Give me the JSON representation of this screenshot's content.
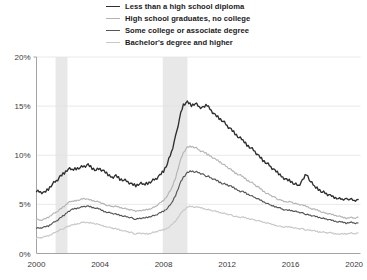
{
  "chart_data": {
    "type": "line",
    "title": "",
    "subtitle": "",
    "xlabel": "",
    "ylabel": "",
    "xlim": [
      2000,
      2020.4
    ],
    "ylim": [
      0,
      20
    ],
    "grid": true,
    "grid_axis": "y",
    "legend_position": "top-center",
    "y_ticks": [
      0,
      5,
      10,
      15,
      20
    ],
    "y_tick_labels": [
      "0%",
      "5%",
      "10%",
      "15%",
      "20%"
    ],
    "x_ticks": [
      2000,
      2004,
      2008,
      2012,
      2016,
      2020
    ],
    "x_tick_labels": [
      "2000",
      "2004",
      "2008",
      "2012",
      "2016",
      "2020"
    ],
    "annotations": [
      {
        "type": "shaded-band",
        "name": "recession-2001",
        "x0": 2001.2,
        "x1": 2001.95,
        "color": "#e8e8e8"
      },
      {
        "type": "shaded-band",
        "name": "recession-2008",
        "x0": 2007.95,
        "x1": 2009.5,
        "color": "#e8e8e8"
      }
    ],
    "series": [
      {
        "name": "Less than a high school diploma",
        "color": "#2e2e2e",
        "width": 1.35,
        "x": [
          2000.0,
          2000.25,
          2000.5,
          2000.75,
          2001.0,
          2001.25,
          2001.5,
          2001.75,
          2002.0,
          2002.25,
          2002.5,
          2002.75,
          2003.0,
          2003.25,
          2003.5,
          2003.75,
          2004.0,
          2004.25,
          2004.5,
          2004.75,
          2005.0,
          2005.25,
          2005.5,
          2005.75,
          2006.0,
          2006.25,
          2006.5,
          2006.75,
          2007.0,
          2007.25,
          2007.5,
          2007.75,
          2008.0,
          2008.25,
          2008.5,
          2008.75,
          2009.0,
          2009.25,
          2009.5,
          2009.75,
          2010.0,
          2010.25,
          2010.5,
          2010.75,
          2011.0,
          2011.25,
          2011.5,
          2011.75,
          2012.0,
          2012.25,
          2012.5,
          2012.75,
          2013.0,
          2013.25,
          2013.5,
          2013.75,
          2014.0,
          2014.25,
          2014.5,
          2014.75,
          2015.0,
          2015.25,
          2015.5,
          2015.75,
          2016.0,
          2016.25,
          2016.5,
          2016.75,
          2017.0,
          2017.25,
          2017.5,
          2017.75,
          2018.0,
          2018.25,
          2018.5,
          2018.75,
          2019.0,
          2019.25,
          2019.5,
          2019.75,
          2020.0,
          2020.25
        ],
        "values": [
          6.4,
          6.3,
          6.2,
          6.6,
          7.1,
          7.4,
          7.8,
          8.2,
          8.6,
          8.5,
          8.7,
          8.8,
          8.9,
          9.0,
          8.7,
          8.5,
          8.6,
          8.3,
          8.0,
          7.8,
          7.9,
          7.6,
          7.5,
          7.3,
          7.0,
          6.9,
          7.1,
          7.0,
          7.2,
          7.4,
          7.6,
          7.9,
          8.4,
          9.2,
          10.3,
          11.8,
          13.8,
          15.2,
          15.4,
          15.1,
          15.3,
          14.9,
          14.8,
          15.1,
          14.6,
          14.1,
          13.8,
          13.5,
          13.0,
          12.6,
          12.2,
          11.8,
          11.5,
          11.1,
          10.8,
          10.4,
          9.9,
          9.5,
          9.2,
          8.8,
          8.4,
          8.1,
          7.8,
          7.5,
          7.4,
          7.1,
          6.9,
          7.4,
          8.1,
          7.3,
          6.8,
          6.6,
          6.3,
          6.1,
          5.9,
          5.7,
          5.6,
          5.5,
          5.5,
          5.6,
          5.4,
          5.5
        ]
      },
      {
        "name": "High school graduates, no college",
        "color": "#b4b4b4",
        "width": 1.15,
        "x": [
          2000.0,
          2000.25,
          2000.5,
          2000.75,
          2001.0,
          2001.25,
          2001.5,
          2001.75,
          2002.0,
          2002.25,
          2002.5,
          2002.75,
          2003.0,
          2003.25,
          2003.5,
          2003.75,
          2004.0,
          2004.25,
          2004.5,
          2004.75,
          2005.0,
          2005.25,
          2005.5,
          2005.75,
          2006.0,
          2006.25,
          2006.5,
          2006.75,
          2007.0,
          2007.25,
          2007.5,
          2007.75,
          2008.0,
          2008.25,
          2008.5,
          2008.75,
          2009.0,
          2009.25,
          2009.5,
          2009.75,
          2010.0,
          2010.25,
          2010.5,
          2010.75,
          2011.0,
          2011.25,
          2011.5,
          2011.75,
          2012.0,
          2012.25,
          2012.5,
          2012.75,
          2013.0,
          2013.25,
          2013.5,
          2013.75,
          2014.0,
          2014.25,
          2014.5,
          2014.75,
          2015.0,
          2015.25,
          2015.5,
          2015.75,
          2016.0,
          2016.25,
          2016.5,
          2016.75,
          2017.0,
          2017.25,
          2017.5,
          2017.75,
          2018.0,
          2018.25,
          2018.5,
          2018.75,
          2019.0,
          2019.25,
          2019.5,
          2019.75,
          2020.0,
          2020.25
        ],
        "values": [
          3.5,
          3.4,
          3.5,
          3.7,
          4.0,
          4.2,
          4.5,
          4.8,
          5.2,
          5.3,
          5.4,
          5.5,
          5.6,
          5.5,
          5.4,
          5.3,
          5.2,
          5.0,
          4.9,
          4.8,
          4.8,
          4.7,
          4.6,
          4.5,
          4.4,
          4.3,
          4.4,
          4.4,
          4.5,
          4.6,
          4.8,
          5.1,
          5.4,
          5.9,
          6.6,
          7.7,
          9.2,
          10.3,
          10.8,
          10.9,
          10.8,
          10.5,
          10.3,
          10.1,
          9.9,
          9.6,
          9.4,
          9.1,
          8.8,
          8.5,
          8.2,
          8.0,
          7.8,
          7.5,
          7.3,
          7.0,
          6.7,
          6.4,
          6.1,
          5.9,
          5.7,
          5.5,
          5.4,
          5.2,
          5.3,
          5.1,
          5.0,
          4.9,
          4.8,
          4.6,
          4.5,
          4.4,
          4.2,
          4.1,
          4.0,
          3.9,
          3.8,
          3.7,
          3.6,
          3.7,
          3.6,
          3.7
        ]
      },
      {
        "name": "Some college or associate degree",
        "color": "#555555",
        "width": 1.15,
        "x": [
          2000.0,
          2000.25,
          2000.5,
          2000.75,
          2001.0,
          2001.25,
          2001.5,
          2001.75,
          2002.0,
          2002.25,
          2002.5,
          2002.75,
          2003.0,
          2003.25,
          2003.5,
          2003.75,
          2004.0,
          2004.25,
          2004.5,
          2004.75,
          2005.0,
          2005.25,
          2005.5,
          2005.75,
          2006.0,
          2006.25,
          2006.5,
          2006.75,
          2007.0,
          2007.25,
          2007.5,
          2007.75,
          2008.0,
          2008.25,
          2008.5,
          2008.75,
          2009.0,
          2009.25,
          2009.5,
          2009.75,
          2010.0,
          2010.25,
          2010.5,
          2010.75,
          2011.0,
          2011.25,
          2011.5,
          2011.75,
          2012.0,
          2012.25,
          2012.5,
          2012.75,
          2013.0,
          2013.25,
          2013.5,
          2013.75,
          2014.0,
          2014.25,
          2014.5,
          2014.75,
          2015.0,
          2015.25,
          2015.5,
          2015.75,
          2016.0,
          2016.25,
          2016.5,
          2016.75,
          2017.0,
          2017.25,
          2017.5,
          2017.75,
          2018.0,
          2018.25,
          2018.5,
          2018.75,
          2019.0,
          2019.25,
          2019.5,
          2019.75,
          2020.0,
          2020.25
        ],
        "values": [
          2.6,
          2.6,
          2.7,
          2.8,
          3.1,
          3.3,
          3.6,
          3.9,
          4.3,
          4.5,
          4.6,
          4.7,
          4.8,
          4.8,
          4.7,
          4.6,
          4.5,
          4.3,
          4.2,
          4.1,
          4.0,
          3.9,
          3.8,
          3.7,
          3.6,
          3.5,
          3.6,
          3.6,
          3.7,
          3.8,
          3.9,
          4.1,
          4.3,
          4.6,
          5.1,
          5.9,
          7.0,
          7.8,
          8.2,
          8.4,
          8.3,
          8.2,
          8.0,
          7.9,
          7.7,
          7.5,
          7.3,
          7.1,
          7.0,
          6.8,
          6.6,
          6.4,
          6.3,
          6.1,
          5.9,
          5.7,
          5.5,
          5.3,
          5.1,
          4.9,
          4.8,
          4.7,
          4.5,
          4.4,
          4.4,
          4.3,
          4.2,
          4.1,
          4.0,
          3.9,
          3.8,
          3.7,
          3.6,
          3.5,
          3.4,
          3.3,
          3.2,
          3.2,
          3.1,
          3.2,
          3.1,
          3.1
        ]
      },
      {
        "name": "Bachelor's degree and higher",
        "color": "#c8c8c8",
        "width": 1.15,
        "x": [
          2000.0,
          2000.25,
          2000.5,
          2000.75,
          2001.0,
          2001.25,
          2001.5,
          2001.75,
          2002.0,
          2002.25,
          2002.5,
          2002.75,
          2003.0,
          2003.25,
          2003.5,
          2003.75,
          2004.0,
          2004.25,
          2004.5,
          2004.75,
          2005.0,
          2005.25,
          2005.5,
          2005.75,
          2006.0,
          2006.25,
          2006.5,
          2006.75,
          2007.0,
          2007.25,
          2007.5,
          2007.75,
          2008.0,
          2008.25,
          2008.5,
          2008.75,
          2009.0,
          2009.25,
          2009.5,
          2009.75,
          2010.0,
          2010.25,
          2010.5,
          2010.75,
          2011.0,
          2011.25,
          2011.5,
          2011.75,
          2012.0,
          2012.25,
          2012.5,
          2012.75,
          2013.0,
          2013.25,
          2013.5,
          2013.75,
          2014.0,
          2014.25,
          2014.5,
          2014.75,
          2015.0,
          2015.25,
          2015.5,
          2015.75,
          2016.0,
          2016.25,
          2016.5,
          2016.75,
          2017.0,
          2017.25,
          2017.5,
          2017.75,
          2018.0,
          2018.25,
          2018.5,
          2018.75,
          2019.0,
          2019.25,
          2019.5,
          2019.75,
          2020.0,
          2020.25
        ],
        "values": [
          1.6,
          1.6,
          1.7,
          1.8,
          2.0,
          2.2,
          2.4,
          2.6,
          2.8,
          2.9,
          3.0,
          3.1,
          3.2,
          3.1,
          3.1,
          3.0,
          2.9,
          2.8,
          2.7,
          2.6,
          2.5,
          2.4,
          2.3,
          2.2,
          2.1,
          2.0,
          2.1,
          2.0,
          2.0,
          2.1,
          2.2,
          2.3,
          2.4,
          2.6,
          2.9,
          3.3,
          3.9,
          4.4,
          4.7,
          4.8,
          4.7,
          4.7,
          4.6,
          4.5,
          4.4,
          4.3,
          4.2,
          4.1,
          4.0,
          3.9,
          3.8,
          3.7,
          3.7,
          3.6,
          3.5,
          3.4,
          3.3,
          3.2,
          3.1,
          3.0,
          2.9,
          2.8,
          2.7,
          2.7,
          2.7,
          2.6,
          2.5,
          2.5,
          2.4,
          2.4,
          2.3,
          2.2,
          2.2,
          2.1,
          2.1,
          2.0,
          2.0,
          2.0,
          2.0,
          2.1,
          2.0,
          2.1
        ]
      }
    ]
  }
}
